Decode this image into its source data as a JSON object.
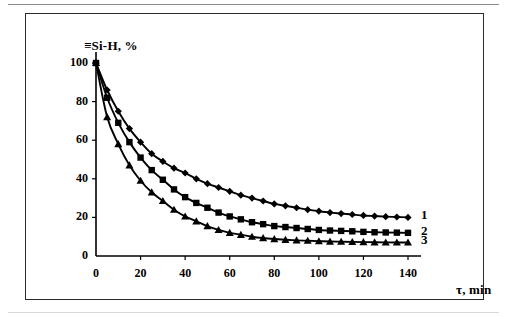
{
  "figure": {
    "frame_color": "#2b2b2b",
    "background": "#ffffff",
    "line_color": "#000000"
  },
  "chart_data": {
    "type": "line",
    "title": "",
    "subtitle": "",
    "xlabel": "τ, min",
    "ylabel": "≡Si-H, %",
    "xlim": [
      0,
      150
    ],
    "ylim": [
      0,
      108
    ],
    "xticks": [
      0,
      20,
      40,
      60,
      80,
      100,
      120,
      140
    ],
    "yticks": [
      0,
      20,
      40,
      60,
      80,
      100
    ],
    "xtick_labels": [
      "0",
      "20",
      "40",
      "60",
      "80",
      "100",
      "120",
      "140"
    ],
    "ytick_labels": [
      "0",
      "20",
      "40",
      "60",
      "80",
      "100"
    ],
    "grid": false,
    "legend": "inline-right-end-labels",
    "x": [
      0,
      5,
      10,
      15,
      20,
      25,
      30,
      35,
      40,
      45,
      50,
      55,
      60,
      65,
      70,
      75,
      80,
      85,
      90,
      95,
      100,
      105,
      110,
      115,
      120,
      125,
      130,
      135,
      140
    ],
    "series": [
      {
        "name": "1",
        "label": "1",
        "marker": "diamond",
        "color": "#000000",
        "values": [
          100,
          86,
          75,
          66,
          59,
          53,
          49,
          45.5,
          43,
          40,
          37.5,
          35.5,
          33.5,
          31.5,
          30,
          28.5,
          27,
          26,
          25,
          24,
          23.2,
          22.5,
          22,
          21.5,
          21,
          20.7,
          20.4,
          20.2,
          20
        ]
      },
      {
        "name": "2",
        "label": "2",
        "marker": "square",
        "color": "#000000",
        "values": [
          100,
          82,
          69,
          59,
          51,
          44.5,
          39.5,
          34.5,
          30.5,
          27.5,
          25,
          22.5,
          20.5,
          19,
          17.5,
          16.5,
          15.5,
          15,
          14.5,
          14,
          13.5,
          13.2,
          13,
          12.8,
          12.5,
          12.3,
          12.2,
          12.1,
          12
        ]
      },
      {
        "name": "3",
        "label": "3",
        "marker": "triangle",
        "color": "#000000",
        "values": [
          100,
          72,
          58,
          47,
          39,
          33,
          28.5,
          24,
          20.5,
          18,
          15.5,
          13.5,
          12,
          11,
          10,
          9.3,
          8.8,
          8.4,
          8.1,
          7.9,
          7.7,
          7.5,
          7.4,
          7.3,
          7.2,
          7.1,
          7.05,
          7.02,
          7
        ]
      }
    ]
  }
}
